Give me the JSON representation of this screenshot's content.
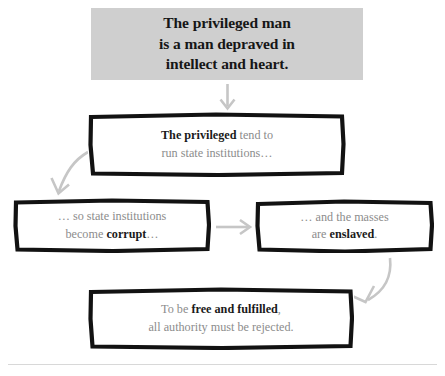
{
  "header": {
    "text": "The privileged man is a man depraved in intellect and heart.",
    "line1": "The privileged man",
    "line2": "is a man depraved in",
    "line3": "intellect and heart.",
    "background_color": "#cfcfcf",
    "text_color": "#161616"
  },
  "nodes": [
    {
      "id": "node-2",
      "name": "privileged-run-institutions",
      "line1_bold": "The privileged",
      "line1_rest": " tend to",
      "line2": "run state institutions…",
      "full_text": "The privileged tend to run state institutions…"
    },
    {
      "id": "node-3",
      "name": "institutions-become-corrupt",
      "line1": "… so state institutions",
      "line2_lead": "become ",
      "line2_bold": "corrupt",
      "line2_tail": "…",
      "full_text": "… so state institutions become corrupt…"
    },
    {
      "id": "node-4",
      "name": "masses-are-enslaved",
      "line1": "… and the masses",
      "line2_lead": "are ",
      "line2_bold": "enslaved",
      "line2_tail": ".",
      "full_text": "… and the masses are enslaved."
    },
    {
      "id": "node-5",
      "name": "reject-all-authority",
      "line1_lead": "To be ",
      "line1_bold": "free and fulfilled",
      "line1_tail": ",",
      "line2": "all authority must be rejected.",
      "full_text": "To be free and fulfilled, all authority must be rejected."
    }
  ],
  "arrows": [
    {
      "name": "arrow-header-to-node2",
      "direction": "down",
      "color": "#c6c6c6"
    },
    {
      "name": "arrow-node2-to-node3",
      "direction": "down-left",
      "color": "#c6c6c6"
    },
    {
      "name": "arrow-node3-to-node4",
      "direction": "right",
      "color": "#c6c6c6"
    },
    {
      "name": "arrow-node4-to-node5",
      "direction": "down-left",
      "color": "#c6c6c6"
    }
  ],
  "style": {
    "body_text_color": "#8c8c8c",
    "bold_text_color": "#1a1a1a",
    "box_border_color": "#121212",
    "rule_color": "#d8d8d8",
    "background": "#ffffff"
  }
}
